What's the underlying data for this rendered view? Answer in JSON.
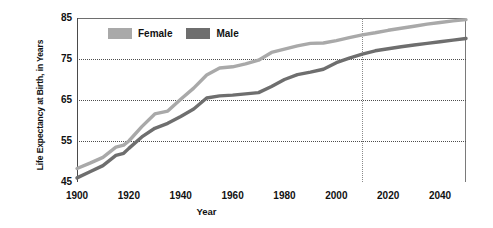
{
  "chart_data": {
    "type": "line",
    "title": "",
    "xlabel": "Year",
    "ylabel": "Life Expectancy at Birth, in Years",
    "xlim": [
      1900,
      2050
    ],
    "ylim": [
      45,
      85
    ],
    "xticks": [
      1900,
      1920,
      1940,
      1960,
      1980,
      2000,
      2020,
      2040
    ],
    "yticks": [
      45,
      55,
      65,
      75,
      85
    ],
    "grid": "horizontal dotted at 55, 65, 75; vertical dotted at 2010",
    "legend_position": "inside top-left",
    "annotations": [
      {
        "type": "vertical-line",
        "x": 2010,
        "style": "dotted",
        "label": ""
      }
    ],
    "x": [
      1900,
      1905,
      1910,
      1915,
      1918,
      1920,
      1925,
      1930,
      1935,
      1940,
      1945,
      1950,
      1955,
      1960,
      1965,
      1970,
      1975,
      1980,
      1985,
      1990,
      1995,
      2000,
      2005,
      2010,
      2015,
      2020,
      2025,
      2030,
      2035,
      2040,
      2045,
      2050
    ],
    "series": [
      {
        "name": "Female",
        "color": "#a9a9a9",
        "values": [
          48.3,
          49.6,
          51.0,
          53.5,
          54.0,
          55.0,
          58.5,
          61.6,
          62.3,
          65.2,
          67.9,
          71.1,
          72.8,
          73.1,
          73.8,
          74.7,
          76.6,
          77.4,
          78.2,
          78.8,
          78.9,
          79.5,
          80.2,
          80.9,
          81.4,
          82.0,
          82.5,
          83.0,
          83.5,
          83.9,
          84.3,
          84.6
        ]
      },
      {
        "name": "Male",
        "color": "#6e6e6e",
        "values": [
          46.0,
          47.5,
          49.0,
          51.5,
          52.0,
          53.2,
          56.0,
          58.1,
          59.3,
          61.0,
          62.8,
          65.5,
          66.0,
          66.2,
          66.5,
          66.8,
          68.3,
          70.0,
          71.2,
          71.8,
          72.5,
          74.1,
          75.2,
          76.2,
          77.0,
          77.5,
          78.0,
          78.4,
          78.8,
          79.2,
          79.6,
          80.0
        ]
      }
    ]
  },
  "legend": {
    "items": [
      {
        "label": "Female",
        "color": "#a9a9a9"
      },
      {
        "label": "Male",
        "color": "#6e6e6e"
      }
    ]
  },
  "axes": {
    "y_title": "Life Expectancy at Birth, in Years",
    "x_title": "Year"
  }
}
